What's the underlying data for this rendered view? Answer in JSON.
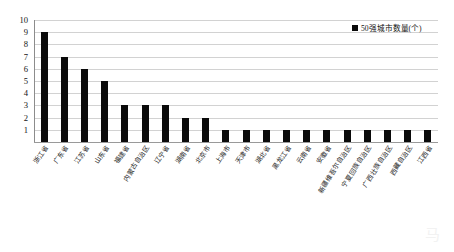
{
  "chart_data": {
    "type": "bar",
    "title": "",
    "xlabel": "",
    "ylabel": "",
    "ylim": [
      0,
      10
    ],
    "yticks": [
      10,
      9,
      8,
      7,
      6,
      5,
      4,
      3,
      2,
      1
    ],
    "grid": true,
    "legend_position": "top-right",
    "series": [
      {
        "name": "50强城市数量(个)",
        "color": "#0a0a0a",
        "values": [
          9,
          7,
          6,
          5,
          3,
          3,
          3,
          2,
          2,
          1,
          1,
          1,
          1,
          1,
          1,
          1,
          1,
          1,
          1,
          1
        ]
      }
    ],
    "categories": [
      "浙江省",
      "广东省",
      "江苏省",
      "山东省",
      "福建省",
      "内蒙古自治区",
      "辽宁省",
      "湖南省",
      "北京市",
      "上海市",
      "天津市",
      "湖北省",
      "黑龙江省",
      "云南省",
      "安徽省",
      "新疆维吾尔自治区",
      "宁夏回族自治区",
      "广西壮族自治区",
      "西藏自治区",
      "江西省"
    ]
  },
  "legend": {
    "entries": [
      {
        "label": "50强城市数量(个)",
        "color": "#0a0a0a",
        "marker": "square-marker"
      }
    ]
  },
  "axes": {
    "y": {
      "max": 10,
      "min": 0,
      "ticks": [
        "10",
        "9",
        "8",
        "7",
        "6",
        "5",
        "4",
        "3",
        "2",
        "1"
      ]
    }
  },
  "watermark": {
    "text": "马"
  }
}
